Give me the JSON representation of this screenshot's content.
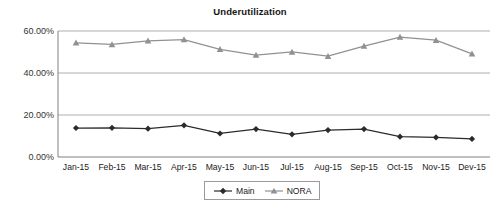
{
  "chart_data": {
    "type": "line",
    "title": "Underutilization",
    "xlabel": "",
    "ylabel": "",
    "ylim": [
      0,
      60
    ],
    "yticks": [
      0,
      20,
      40,
      60
    ],
    "ytick_labels": [
      "0.00%",
      "20.00%",
      "40.00%",
      "60.00%"
    ],
    "grid": true,
    "legend_position": "bottom",
    "categories": [
      "Jan-15",
      "Feb-15",
      "Mar-15",
      "Apr-15",
      "May-15",
      "Jun-15",
      "Jul-15",
      "Aug-15",
      "Sep-15",
      "Oct-15",
      "Nov-15",
      "Dev-15"
    ],
    "series": [
      {
        "name": "Main",
        "color": "#2b2b2b",
        "marker": "diamond",
        "values": [
          13.8,
          13.9,
          13.5,
          15.1,
          11.2,
          13.3,
          10.8,
          12.8,
          13.3,
          9.7,
          9.3,
          8.6
        ]
      },
      {
        "name": "NORA",
        "color": "#919191",
        "marker": "triangle",
        "values": [
          54.4,
          53.6,
          55.3,
          55.9,
          51.3,
          48.5,
          50.0,
          48.0,
          52.8,
          57.1,
          55.6,
          49.1
        ]
      }
    ]
  },
  "legend": {
    "items": [
      {
        "label": "Main"
      },
      {
        "label": "NORA"
      }
    ]
  },
  "colors": {
    "main_series": "#2b2b2b",
    "nora_series": "#919191",
    "gridline": "#a6a6a6",
    "axis": "#808080",
    "background": "#ffffff"
  }
}
